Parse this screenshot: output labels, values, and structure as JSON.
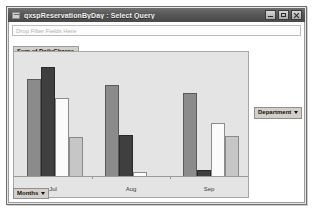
{
  "window": {
    "title": "qxspReservationByDay : Select Query",
    "app_icon": "access-query-icon",
    "buttons": {
      "minimize": "Minimize",
      "restore": "Restore",
      "close": "Close"
    }
  },
  "filter_zone": {
    "placeholder": "Drop Filter Fields Here"
  },
  "series_caption": "Sum of DailyCharge",
  "legend": {
    "department_button": "Department",
    "caret": "chevron-down-icon"
  },
  "months_button": "Months",
  "chart_data": {
    "type": "bar",
    "title": "Sum of DailyCharge",
    "xlabel": "Months",
    "ylabel": "Sum of DailyCharge",
    "categories": [
      "Jul",
      "Aug",
      "Sep"
    ],
    "grid": false,
    "legend_position": "right",
    "legend_field": "Department",
    "ylim": [
      0,
      100
    ],
    "series": [
      {
        "name": "Series 1",
        "color": "#8b8b8b",
        "values": [
          82,
          77,
          70
        ]
      },
      {
        "name": "Series 2",
        "color": "#3f3f3f",
        "values": [
          92,
          35,
          6
        ]
      },
      {
        "name": "Series 3",
        "color": "#fbfbfb",
        "values": [
          66,
          4,
          45
        ]
      },
      {
        "name": "Series 4",
        "color": "#c6c6c6",
        "values": [
          33,
          0,
          34
        ]
      }
    ]
  }
}
